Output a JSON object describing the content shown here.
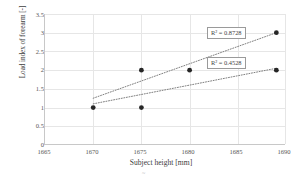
{
  "chart_data": {
    "type": "scatter",
    "title": "",
    "xlabel": "Subject height [mm]",
    "ylabel": "Load index of forearm [-]",
    "xlim": [
      1665,
      1690
    ],
    "ylim": [
      0,
      3.5
    ],
    "xticks": [
      "1665",
      "1670",
      "1675",
      "1680",
      "1685",
      "1690"
    ],
    "yticks": [
      "0",
      "0.5",
      "1",
      "1.5",
      "2",
      "2.5",
      "3",
      "3.5"
    ],
    "grid": true,
    "legend": "none",
    "points": [
      {
        "x": 1670,
        "y": 1
      },
      {
        "x": 1675,
        "y": 2
      },
      {
        "x": 1675,
        "y": 1
      },
      {
        "x": 1680,
        "y": 2
      },
      {
        "x": 1689,
        "y": 3
      },
      {
        "x": 1689,
        "y": 2
      }
    ],
    "series": [
      {
        "name": "upper trendline",
        "type": "linear-fit",
        "style": "dotted",
        "x": [
          1670,
          1689
        ],
        "y": [
          1.25,
          3.0
        ],
        "r_squared_label": "R² = 0.8728",
        "r_squared": 0.8728
      },
      {
        "name": "lower trendline",
        "type": "linear-fit",
        "style": "dotted",
        "x": [
          1670,
          1689
        ],
        "y": [
          1.1,
          2.05
        ],
        "r_squared_label": "R² = 0.4528",
        "r_squared": 0.4528
      }
    ],
    "annotations": [
      {
        "name": "r2-upper",
        "text": "R² = 0.8728",
        "x": 1686.5,
        "y": 3.0
      },
      {
        "name": "r2-lower",
        "text": "R² = 0.4528",
        "x": 1686.5,
        "y": 2.2
      }
    ],
    "colors": {
      "marker": "#262626",
      "trendline": "#808080",
      "grid": "#e6e6e6",
      "axis": "#c8c8c8",
      "text": "#404040"
    },
    "caption_artifact": "~"
  }
}
